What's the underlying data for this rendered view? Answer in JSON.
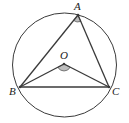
{
  "diagram": {
    "type": "geometry",
    "colors": {
      "stroke": "#3a3a3a",
      "angle_fill": "#bdbdbd",
      "background": "#ffffff"
    },
    "circle": {
      "cx": 64.5,
      "cy": 65,
      "r": 52
    },
    "points": {
      "A": {
        "label": "A",
        "x": 78,
        "y": 15,
        "label_x": 74,
        "label_y": 10
      },
      "O": {
        "label": "O",
        "x": 64,
        "y": 64,
        "label_x": 60,
        "label_y": 59
      },
      "B": {
        "label": "B",
        "x": 20,
        "y": 87,
        "label_x": 9,
        "label_y": 95
      },
      "C": {
        "label": "C",
        "x": 109,
        "y": 87,
        "label_x": 112,
        "label_y": 95
      }
    },
    "segments": [
      {
        "from": "A",
        "to": "B"
      },
      {
        "from": "A",
        "to": "C"
      },
      {
        "from": "B",
        "to": "C"
      },
      {
        "from": "O",
        "to": "B"
      },
      {
        "from": "O",
        "to": "C"
      }
    ],
    "angle_marks": [
      {
        "vertex": "A",
        "between": [
          "B",
          "C"
        ]
      },
      {
        "vertex": "O",
        "between": [
          "B",
          "C"
        ]
      }
    ]
  }
}
